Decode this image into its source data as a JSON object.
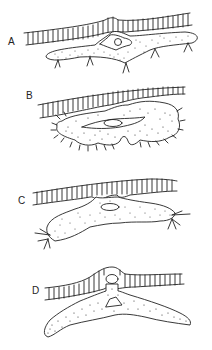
{
  "figure": {
    "panels": [
      {
        "label": "A",
        "description": "flattened cell beneath striated fiber with dendritic processes"
      },
      {
        "label": "B",
        "description": "rounded cell with fine hair-like projections beneath fiber"
      },
      {
        "label": "C",
        "description": "elongated cell extending along fiber with branched ends"
      },
      {
        "label": "D",
        "description": "cell with vesicle penetrating through the fiber layer"
      }
    ]
  }
}
